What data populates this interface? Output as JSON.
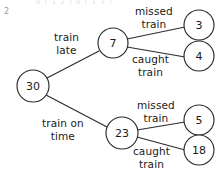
{
  "page": {
    "corner_index": "2",
    "top_cutoff_text": "0 ( 1   2 )              0 ( 1   3 )"
  },
  "diagram": {
    "type": "probability-tree",
    "nodes": [
      {
        "id": "root",
        "label": "30",
        "cx": 33,
        "cy": 86,
        "r": 16
      },
      {
        "id": "late",
        "label": "7",
        "cx": 113,
        "cy": 43,
        "r": 15
      },
      {
        "id": "ontime",
        "label": "23",
        "cx": 122,
        "cy": 133,
        "r": 16
      },
      {
        "id": "late-missed",
        "label": "3",
        "cx": 199,
        "cy": 25,
        "r": 15
      },
      {
        "id": "late-caught",
        "label": "4",
        "cx": 199,
        "cy": 56,
        "r": 15
      },
      {
        "id": "ontime-missed",
        "label": "5",
        "cx": 199,
        "cy": 120,
        "r": 15
      },
      {
        "id": "ontime-caught",
        "label": "18",
        "cx": 199,
        "cy": 150,
        "r": 15
      }
    ],
    "edges": [
      {
        "id": "edge-root-late",
        "from": "root",
        "to": "late",
        "x1": 47,
        "y1": 78,
        "x2": 99,
        "y2": 51
      },
      {
        "id": "edge-root-ontime",
        "from": "root",
        "to": "ontime",
        "x1": 46,
        "y1": 95,
        "x2": 107,
        "y2": 127
      },
      {
        "id": "edge-late-missed",
        "from": "late",
        "to": "late-missed",
        "x1": 127,
        "y1": 39,
        "x2": 185,
        "y2": 27
      },
      {
        "id": "edge-late-caught",
        "from": "late",
        "to": "late-caught",
        "x1": 127,
        "y1": 47,
        "x2": 185,
        "y2": 57
      },
      {
        "id": "edge-ontime-missed",
        "from": "ontime",
        "to": "ontime-missed",
        "x1": 137,
        "y1": 130,
        "x2": 185,
        "y2": 122
      },
      {
        "id": "edge-ontime-caught",
        "from": "ontime",
        "to": "ontime-caught",
        "x1": 137,
        "y1": 137,
        "x2": 185,
        "y2": 150
      }
    ],
    "edge_labels": [
      {
        "id": "label-train-late",
        "line1": "train",
        "line2": "late",
        "left": 54,
        "top": 31
      },
      {
        "id": "label-train-on-time",
        "line1": "train on",
        "line2": "time",
        "left": 42,
        "top": 117
      },
      {
        "id": "label-missed-train-1",
        "line1": "missed",
        "line2": "train",
        "left": 135,
        "top": 5
      },
      {
        "id": "label-caught-train-1",
        "line1": "caught",
        "line2": "train",
        "left": 132,
        "top": 53
      },
      {
        "id": "label-missed-train-2",
        "line1": "missed",
        "line2": "train",
        "left": 137,
        "top": 99
      },
      {
        "id": "label-caught-train-2",
        "line1": "caught",
        "line2": "train",
        "left": 133,
        "top": 145
      }
    ]
  }
}
